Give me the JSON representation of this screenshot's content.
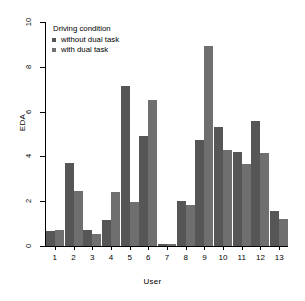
{
  "chart_data": {
    "type": "bar",
    "title": "",
    "xlabel": "User",
    "ylabel": "EDA",
    "categories": [
      "1",
      "2",
      "3",
      "4",
      "5",
      "6",
      "7",
      "8",
      "9",
      "10",
      "11",
      "12",
      "13"
    ],
    "ylim": [
      0,
      10
    ],
    "yticks": [
      0,
      2,
      4,
      6,
      8,
      10
    ],
    "grid": false,
    "legend_title": "Driving condition",
    "legend_position": "top-left",
    "series": [
      {
        "name": "without dual task",
        "color": "#565656",
        "values": [
          0.65,
          3.7,
          0.7,
          1.15,
          7.15,
          4.9,
          0.08,
          2.0,
          4.75,
          5.3,
          4.2,
          5.6,
          1.55
        ]
      },
      {
        "name": "with dual task",
        "color": "#6f6f6f",
        "values": [
          0.7,
          2.45,
          0.55,
          2.4,
          1.95,
          6.5,
          0.1,
          1.85,
          8.95,
          4.3,
          3.65,
          4.15,
          1.2
        ]
      }
    ]
  },
  "axis": {
    "y_label": "EDA",
    "x_label": "User"
  }
}
